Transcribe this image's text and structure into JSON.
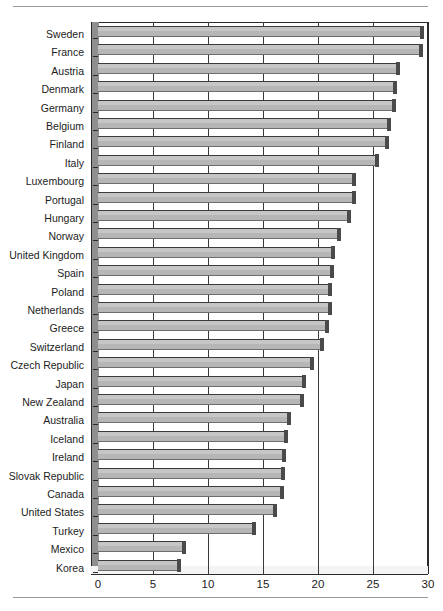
{
  "figure": {
    "has_top_rule": true,
    "has_bottom_rule": true,
    "background_color": "#ffffff",
    "bar_color": "#b6b6b6",
    "bar_edge_color": "#3b3b3b",
    "axis_color": "#2b2b2b"
  },
  "chart_data": {
    "type": "bar",
    "orientation": "horizontal",
    "title": "",
    "subtitle": "",
    "xlabel": "",
    "ylabel": "",
    "xlim": [
      0,
      30
    ],
    "ylim": null,
    "grid": true,
    "grid_axis": "x",
    "legend": false,
    "legend_position": "none",
    "xticks": [
      0,
      5,
      10,
      15,
      20,
      25,
      30
    ],
    "xtick_labels": [
      "0",
      "5",
      "10",
      "15",
      "20",
      "25",
      "30"
    ],
    "categories": [
      "Sweden",
      "France",
      "Austria",
      "Denmark",
      "Germany",
      "Belgium",
      "Finland",
      "Italy",
      "Luxembourg",
      "Portugal",
      "Hungary",
      "Norway",
      "United Kingdom",
      "Spain",
      "Poland",
      "Netherlands",
      "Greece",
      "Switzerland",
      "Czech Republic",
      "Japan",
      "New Zealand",
      "Australia",
      "Iceland",
      "Ireland",
      "Slovak Republic",
      "Canada",
      "United States",
      "Turkey",
      "Mexico",
      "Korea"
    ],
    "values": [
      29.3,
      29.2,
      27.1,
      26.8,
      26.7,
      26.3,
      26.1,
      25.2,
      23.1,
      23.1,
      22.6,
      21.7,
      21.2,
      21.1,
      20.9,
      20.9,
      20.6,
      20.2,
      19.3,
      18.5,
      18.4,
      17.2,
      16.9,
      16.7,
      16.6,
      16.5,
      15.9,
      14.0,
      7.6,
      7.2
    ]
  }
}
